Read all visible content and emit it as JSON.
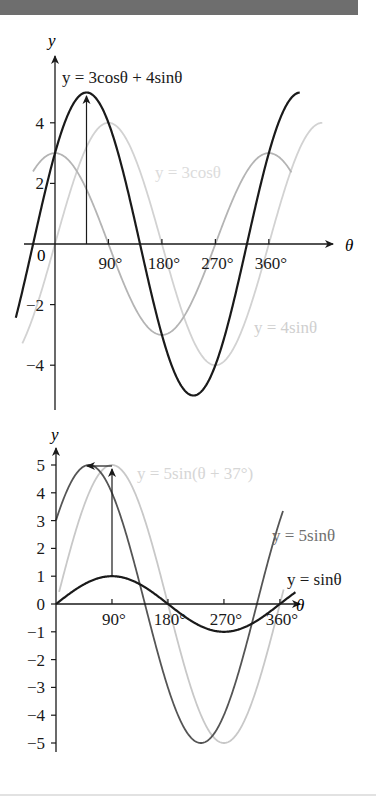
{
  "page": {
    "header_band_color": "#6e6e6e"
  },
  "chart_data": [
    {
      "type": "line",
      "title": "",
      "xlabel": "θ",
      "ylabel": "y",
      "xticks": [
        "0",
        "90°",
        "180°",
        "270°",
        "360°"
      ],
      "xtick_values": [
        0,
        90,
        180,
        270,
        360
      ],
      "yticks": [
        "−4",
        "−2",
        "2",
        "4"
      ],
      "ytick_values": [
        -4,
        -2,
        2,
        4
      ],
      "xlim": [
        -66,
        412
      ],
      "ylim": [
        -5,
        5
      ],
      "grid": false,
      "annotations": [
        {
          "type": "vertical-arrow",
          "x": 53,
          "from_y": 0,
          "to_y": 5
        }
      ],
      "series": [
        {
          "name": "y = 3cosθ + 4sinθ",
          "formula": "3cos(θ) + 4sin(θ)",
          "x_range": [
            -66,
            412
          ],
          "color": "#1a1a1a",
          "amplitude": 5,
          "peak_at": 53
        },
        {
          "name": "y = 3cosθ",
          "formula": "3cos(θ)",
          "x_range": [
            -37,
            398
          ],
          "color": "#b4b4b4",
          "amplitude": 3
        },
        {
          "name": "y = 4sinθ",
          "formula": "4sin(θ)",
          "x_range": [
            -55,
            450
          ],
          "color": "#d2d2d2",
          "amplitude": 4
        }
      ],
      "labels": {
        "y_axis": "y",
        "x_axis": "θ",
        "origin": "0",
        "combined": "y = 3cosθ + 4sinθ",
        "cos": "y = 3cosθ",
        "sin": "y = 4sinθ"
      }
    },
    {
      "type": "line",
      "title": "",
      "xlabel": "θ",
      "ylabel": "y",
      "xticks": [
        "90°",
        "180°",
        "270°",
        "360°"
      ],
      "xtick_values": [
        90,
        180,
        270,
        360
      ],
      "yticks": [
        "5",
        "4",
        "3",
        "2",
        "1",
        "0",
        "−1",
        "−2",
        "−3",
        "−4",
        "−5"
      ],
      "ytick_values": [
        5,
        4,
        3,
        2,
        1,
        0,
        -1,
        -2,
        -3,
        -4,
        -5
      ],
      "xlim": [
        0,
        380
      ],
      "ylim": [
        -5,
        5
      ],
      "grid": false,
      "annotations": [
        {
          "type": "vertical-arrow",
          "x": 90,
          "from_y": 1,
          "to_y": 4.8
        },
        {
          "type": "horizontal-arrow",
          "y": 5,
          "from_x": 90,
          "to_x": 53
        }
      ],
      "series": [
        {
          "name": "y = 5sinθ",
          "formula": "5sin(θ+37°)",
          "x_range": [
            0,
            365
          ],
          "color": "#555555",
          "amplitude": 5
        },
        {
          "name": "y = 5sin(θ + 37°)",
          "formula": "5sin(θ)",
          "x_range": [
            5,
            366
          ],
          "color": "#c8c8c8",
          "amplitude": 5
        },
        {
          "name": "y = sinθ",
          "formula": "sin(θ)",
          "x_range": [
            0,
            385
          ],
          "color": "#1a1a1a",
          "amplitude": 1
        }
      ],
      "labels": {
        "y_axis": "y",
        "x_axis": "θ",
        "shifted": "y = 5sin(θ + 37°)",
        "five_sin": "y = 5sinθ",
        "sin": "y = sinθ"
      }
    }
  ]
}
